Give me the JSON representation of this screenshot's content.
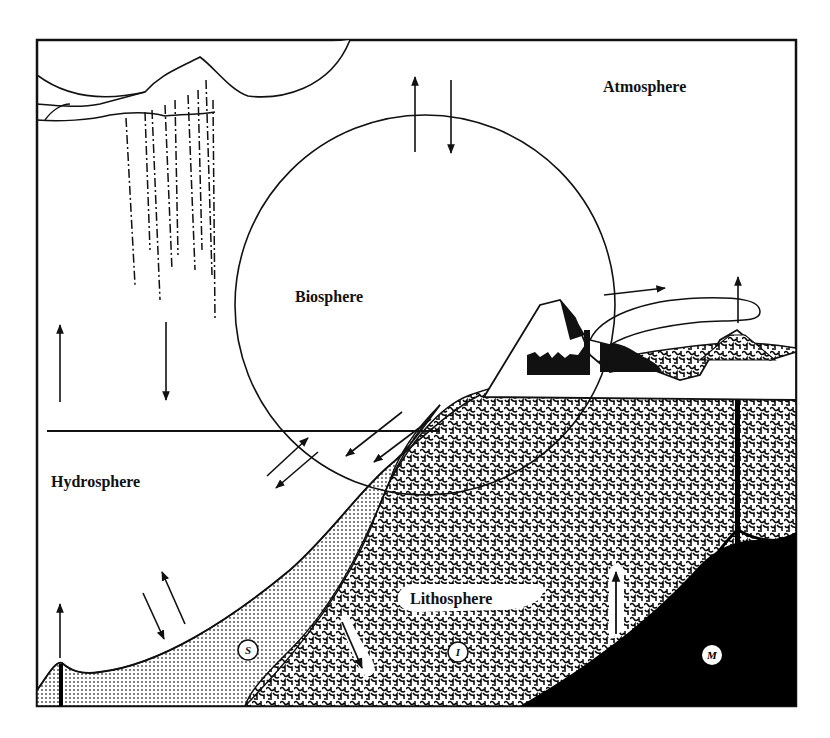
{
  "diagram": {
    "title": "",
    "spheres": {
      "atmosphere": "Atmosphere",
      "biosphere": "Biosphere",
      "hydrosphere": "Hydrosphere",
      "lithosphere": "Lithosphere"
    },
    "layer_markers": {
      "sediment": "S",
      "igneous": "I",
      "mantle": "M"
    },
    "colors": {
      "ink": "#111111",
      "paper": "#ffffff",
      "sediment_dot": "#555555",
      "mantle": "#000000"
    }
  }
}
